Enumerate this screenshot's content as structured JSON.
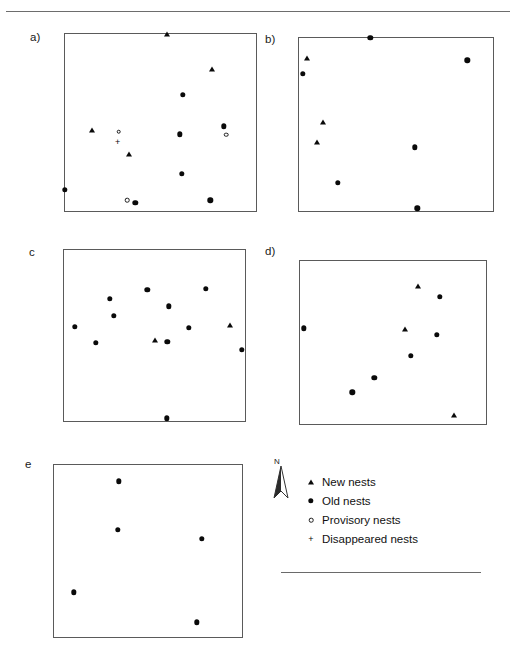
{
  "figure": {
    "title": "",
    "panels": [
      {
        "id": "a",
        "label": "a)",
        "box": {
          "x": 64,
          "y": 33,
          "w": 193,
          "h": 179
        },
        "label_pos": {
          "x": 30,
          "y": 31
        },
        "markers": [
          {
            "type": "new",
            "x": 0.535,
            "y": 0.0
          },
          {
            "type": "new",
            "x": 0.772,
            "y": 0.2
          },
          {
            "type": "old",
            "x": 0.617,
            "y": 0.345
          },
          {
            "type": "new",
            "x": 0.142,
            "y": 0.54
          },
          {
            "type": "prov",
            "x": 0.281,
            "y": 0.552
          },
          {
            "type": "old",
            "x": 0.83,
            "y": 0.522
          },
          {
            "type": "prov",
            "x": 0.843,
            "y": 0.57
          },
          {
            "type": "dis",
            "x": 0.275,
            "y": 0.612
          },
          {
            "type": "old",
            "x": 0.6,
            "y": 0.566
          },
          {
            "type": "new",
            "x": 0.333,
            "y": 0.678
          },
          {
            "type": "old",
            "x": 0.61,
            "y": 0.79
          },
          {
            "type": "old",
            "x": 0.0,
            "y": 0.88
          },
          {
            "type": "prov",
            "x": 0.325,
            "y": 0.94
          },
          {
            "type": "old",
            "x": 0.368,
            "y": 0.952
          },
          {
            "type": "old",
            "x": 0.76,
            "y": 0.94
          }
        ]
      },
      {
        "id": "b",
        "label": "b)",
        "box": {
          "x": 298,
          "y": 37,
          "w": 196,
          "h": 175
        },
        "label_pos": {
          "x": 265,
          "y": 33
        },
        "markers": [
          {
            "type": "old",
            "x": 0.368,
            "y": 0.0
          },
          {
            "type": "new",
            "x": 0.04,
            "y": 0.113
          },
          {
            "type": "old",
            "x": 0.868,
            "y": 0.13
          },
          {
            "type": "old",
            "x": 0.02,
            "y": 0.208
          },
          {
            "type": "new",
            "x": 0.122,
            "y": 0.485
          },
          {
            "type": "new",
            "x": 0.092,
            "y": 0.6
          },
          {
            "type": "old",
            "x": 0.598,
            "y": 0.632
          },
          {
            "type": "old",
            "x": 0.2,
            "y": 0.838
          },
          {
            "type": "old",
            "x": 0.61,
            "y": 0.985
          }
        ]
      },
      {
        "id": "c",
        "label": "c",
        "box": {
          "x": 63,
          "y": 249,
          "w": 183,
          "h": 173
        },
        "label_pos": {
          "x": 29,
          "y": 246
        },
        "markers": [
          {
            "type": "old",
            "x": 0.46,
            "y": 0.232
          },
          {
            "type": "old",
            "x": 0.785,
            "y": 0.228
          },
          {
            "type": "old",
            "x": 0.253,
            "y": 0.285
          },
          {
            "type": "old",
            "x": 0.578,
            "y": 0.33
          },
          {
            "type": "old",
            "x": 0.275,
            "y": 0.385
          },
          {
            "type": "new",
            "x": 0.918,
            "y": 0.44
          },
          {
            "type": "old",
            "x": 0.06,
            "y": 0.45
          },
          {
            "type": "old",
            "x": 0.69,
            "y": 0.455
          },
          {
            "type": "new",
            "x": 0.505,
            "y": 0.525
          },
          {
            "type": "old",
            "x": 0.175,
            "y": 0.543
          },
          {
            "type": "old",
            "x": 0.57,
            "y": 0.537
          },
          {
            "type": "old",
            "x": 0.982,
            "y": 0.585
          },
          {
            "type": "old",
            "x": 0.568,
            "y": 0.985
          }
        ]
      },
      {
        "id": "d",
        "label": "d)",
        "box": {
          "x": 299,
          "y": 260,
          "w": 188,
          "h": 165
        },
        "label_pos": {
          "x": 265,
          "y": 245
        },
        "markers": [
          {
            "type": "new",
            "x": 0.635,
            "y": 0.155
          },
          {
            "type": "old",
            "x": 0.75,
            "y": 0.218
          },
          {
            "type": "old",
            "x": 0.022,
            "y": 0.412
          },
          {
            "type": "new",
            "x": 0.565,
            "y": 0.418
          },
          {
            "type": "old",
            "x": 0.735,
            "y": 0.452
          },
          {
            "type": "old",
            "x": 0.595,
            "y": 0.58
          },
          {
            "type": "old",
            "x": 0.4,
            "y": 0.715
          },
          {
            "type": "old",
            "x": 0.282,
            "y": 0.805
          },
          {
            "type": "new",
            "x": 0.828,
            "y": 0.945
          }
        ]
      },
      {
        "id": "e",
        "label": "e",
        "box": {
          "x": 53,
          "y": 464,
          "w": 190,
          "h": 174
        },
        "label_pos": {
          "x": 25,
          "y": 458
        },
        "markers": [
          {
            "type": "old",
            "x": 0.345,
            "y": 0.095
          },
          {
            "type": "old",
            "x": 0.34,
            "y": 0.375
          },
          {
            "type": "old",
            "x": 0.785,
            "y": 0.43
          },
          {
            "type": "old",
            "x": 0.105,
            "y": 0.74
          },
          {
            "type": "old",
            "x": 0.76,
            "y": 0.915
          }
        ]
      }
    ]
  },
  "legend": {
    "north_label": "N",
    "items": [
      {
        "symbol": "new",
        "label": "New nests"
      },
      {
        "symbol": "old",
        "label": "Old nests"
      },
      {
        "symbol": "prov",
        "label": "Provisory nests"
      },
      {
        "symbol": "dis",
        "label": "Disappeared nests"
      }
    ]
  },
  "colors": {
    "marker": "#0a0a0a",
    "panel_border": "#5a5a5a",
    "rule": "#6d6d6d",
    "text": "#111111"
  }
}
